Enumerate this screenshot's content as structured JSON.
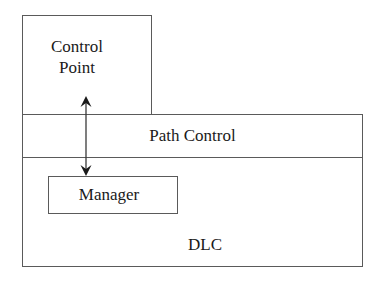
{
  "diagram": {
    "nodes": [
      {
        "id": "control_point",
        "label_line1": "Control",
        "label_line2": "Point"
      },
      {
        "id": "path_control",
        "label": "Path Control"
      },
      {
        "id": "manager",
        "label": "Manager"
      },
      {
        "id": "dlc",
        "label": "DLC"
      }
    ],
    "edges": [
      {
        "from": "control_point",
        "to": "manager",
        "direction": "bidirectional"
      }
    ],
    "colors": {
      "line": "#5a5a5a",
      "text": "#1a1a1a",
      "background": "#ffffff"
    }
  }
}
